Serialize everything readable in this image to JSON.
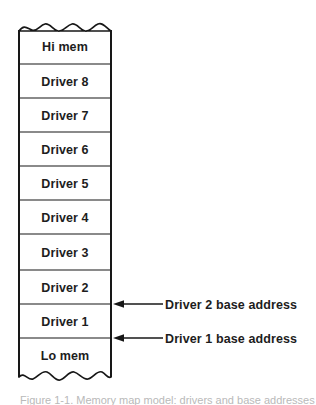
{
  "figure": {
    "caption": "Figure 1-1. Memory map model: drivers and base addresses",
    "colors": {
      "stroke": "#171717",
      "cell_fill": "#ffffff",
      "text": "#1d1d1d",
      "caption_text": "#b9b9b9",
      "background": "#ffffff"
    }
  },
  "memory_map": {
    "name": "memory-map-column",
    "torn_top": true,
    "torn_bottom": true,
    "cells": [
      {
        "label": "Hi mem",
        "name": "cell-hi-mem"
      },
      {
        "label": "Driver 8",
        "name": "cell-driver-8"
      },
      {
        "label": "Driver 7",
        "name": "cell-driver-7"
      },
      {
        "label": "Driver 6",
        "name": "cell-driver-6"
      },
      {
        "label": "Driver 5",
        "name": "cell-driver-5"
      },
      {
        "label": "Driver 4",
        "name": "cell-driver-4"
      },
      {
        "label": "Driver 3",
        "name": "cell-driver-3"
      },
      {
        "label": "Driver 2",
        "name": "cell-driver-2"
      },
      {
        "label": "Driver 1",
        "name": "cell-driver-1"
      },
      {
        "label": "Lo mem",
        "name": "cell-lo-mem"
      }
    ]
  },
  "callouts": [
    {
      "label": "Driver 2 base address",
      "name": "callout-driver-2-base-address",
      "arrow": "arrow-left-icon"
    },
    {
      "label": "Driver 1 base address",
      "name": "callout-driver-1-base-address",
      "arrow": "arrow-left-icon"
    }
  ]
}
